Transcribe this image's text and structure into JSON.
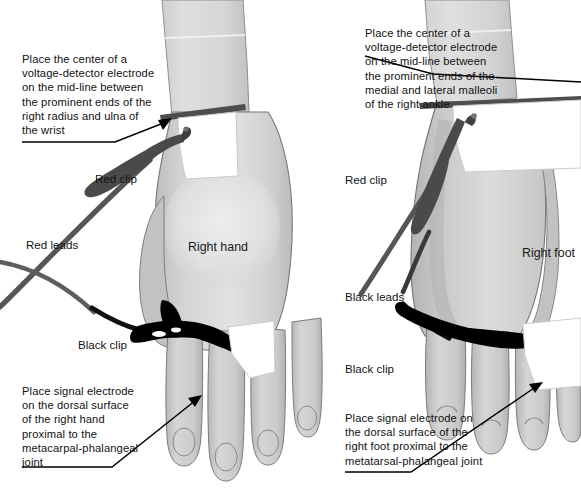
{
  "figure": {
    "width": 581,
    "height": 489,
    "background_color": "#ffffff"
  },
  "colors": {
    "skin_light": "#d9d9d9",
    "skin_mid": "#c4c4c4",
    "skin_shadow": "#ababab",
    "skin_highlight": "#e8e8e8",
    "outline": "#5a5a5a",
    "red_lead": "#545454",
    "black_lead": "#000000",
    "electrode_band": "#4d4d4d",
    "electrode_patch": "#ffffff",
    "text": "#111111",
    "leader_line": "#000000"
  },
  "panels": [
    {
      "id": "hand-panel",
      "region_label": "Right hand",
      "captions": [
        {
          "id": "wrist-electrode-caption",
          "text": "Place the center of a\nvoltage-detector electrode\non the mid-line between\nthe prominent ends of the\nright radius and ulna of\nthe wrist"
        },
        {
          "id": "hand-signal-electrode-caption",
          "text": "Place signal electrode\non the dorsal surface\nof the right hand\nproximal to the\nmetacarpal-phalangeal\njoint"
        }
      ],
      "labels": [
        {
          "id": "hand-red-clip-label",
          "text": "Red clip"
        },
        {
          "id": "hand-red-leads-label",
          "text": "Red leads"
        },
        {
          "id": "hand-black-clip-label",
          "text": "Black clip"
        }
      ]
    },
    {
      "id": "foot-panel",
      "region_label": "Right foot",
      "captions": [
        {
          "id": "ankle-electrode-caption",
          "text": "Place the center of a\nvoltage-detector electrode\non the mid-line between\nthe prominent ends of the\nmedial and lateral malleoli\nof the right ankle"
        },
        {
          "id": "foot-signal-electrode-caption",
          "text": "Place signal electrode on\nthe dorsal surface of the\nright foot proximal to the\nmetatarsal-phalangeal joint"
        }
      ],
      "labels": [
        {
          "id": "foot-red-clip-label",
          "text": "Red clip"
        },
        {
          "id": "foot-black-leads-label",
          "text": "Black leads"
        },
        {
          "id": "foot-black-clip-label",
          "text": "Black clip"
        }
      ]
    }
  ]
}
